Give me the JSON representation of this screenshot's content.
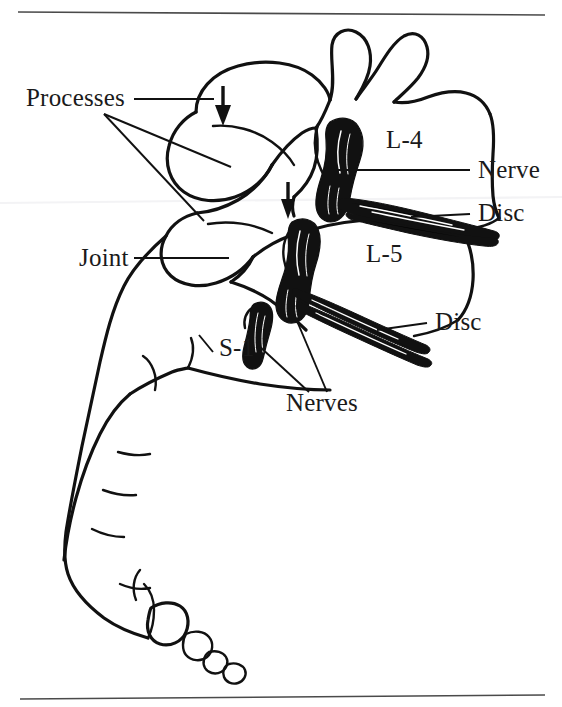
{
  "figure": {
    "background_color": "#ffffff",
    "ink_color": "#111111",
    "rule_color": "#4a4a4a",
    "rules": {
      "top_label": "top-horizontal-rule",
      "bottom_label": "bottom-horizontal-rule"
    },
    "labels": [
      {
        "id": "processes",
        "text": "Processes",
        "x": 26,
        "y": 106,
        "anchor": "start"
      },
      {
        "id": "joint",
        "text": "Joint",
        "x": 79,
        "y": 266,
        "anchor": "start"
      },
      {
        "id": "l4",
        "text": "L-4",
        "x": 386,
        "y": 148,
        "anchor": "start"
      },
      {
        "id": "l5",
        "text": "L-5",
        "x": 366,
        "y": 262,
        "anchor": "start"
      },
      {
        "id": "s1",
        "text": "S-1",
        "x": 219,
        "y": 356,
        "anchor": "start"
      },
      {
        "id": "nerve",
        "text": "Nerve",
        "x": 478,
        "y": 178,
        "anchor": "start"
      },
      {
        "id": "disc_l4",
        "text": "Disc",
        "x": 478,
        "y": 221,
        "anchor": "start"
      },
      {
        "id": "disc_l5",
        "text": "Disc",
        "x": 435,
        "y": 330,
        "anchor": "start"
      },
      {
        "id": "nerves",
        "text": "Nerves",
        "x": 286,
        "y": 411,
        "anchor": "start"
      }
    ],
    "annotations": {
      "arrow_upper": "downward-arrow-upper-facet",
      "arrow_lower": "downward-arrow-lower-facet",
      "vertebra_l4": "L-4 vertebral body",
      "vertebra_l5": "L-5 vertebral body",
      "sacrum": "sacrum and coccyx outline",
      "nerve_root_l4": "L-4 nerve root",
      "nerve_root_l5": "L-5 nerve root",
      "nerve_root_s1": "S-1 nerve root",
      "disc_upper": "L4-L5 intervertebral disc",
      "disc_lower": "L5-S1 intervertebral disc"
    }
  }
}
